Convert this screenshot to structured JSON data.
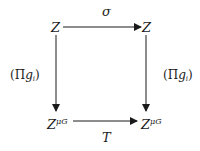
{
  "diagram": {
    "type": "commutative-square",
    "nodes": {
      "top_left": {
        "base": "Z",
        "sup": ""
      },
      "top_right": {
        "base": "Z",
        "sup": ""
      },
      "bottom_left": {
        "base": "Z",
        "sup": "μG"
      },
      "bottom_right": {
        "base": "Z",
        "sup": "μG"
      }
    },
    "arrows": {
      "top": {
        "from": "top_left",
        "to": "top_right",
        "label": "σ"
      },
      "bottom": {
        "from": "bottom_left",
        "to": "bottom_right",
        "label": "T"
      },
      "left": {
        "from": "top_left",
        "to": "bottom_left",
        "label_open": "(",
        "label_pi": "Π",
        "label_g": "g",
        "label_sub": "i",
        "label_close": ")"
      },
      "right": {
        "from": "top_right",
        "to": "bottom_right",
        "label_open": "(",
        "label_pi": "Π",
        "label_g": "g",
        "label_sub": "i",
        "label_close": ")"
      }
    }
  }
}
